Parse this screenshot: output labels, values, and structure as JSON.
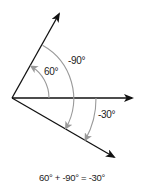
{
  "diagram": {
    "type": "angle-addition",
    "rays": [
      {
        "name": "ray-60",
        "angle_deg": 60,
        "color": "#111111"
      },
      {
        "name": "ray-0",
        "angle_deg": 0,
        "color": "#111111"
      },
      {
        "name": "ray-neg30",
        "angle_deg": -30,
        "color": "#111111"
      }
    ],
    "arcs": [
      {
        "name": "arc-60",
        "from_deg": 0,
        "to_deg": 60,
        "label": "60°",
        "color": "#999999"
      },
      {
        "name": "arc-neg90",
        "from_deg": 60,
        "to_deg": -30,
        "label": "-90°",
        "color": "#999999"
      },
      {
        "name": "arc-neg30",
        "from_deg": 0,
        "to_deg": -30,
        "label": "-30°",
        "color": "#999999"
      }
    ],
    "labels": {
      "angle_60": "60°",
      "angle_neg90": "-90°",
      "angle_neg30": "-30°"
    },
    "equation": "60° + -90° = -30°",
    "colors": {
      "ray": "#111111",
      "arc": "#999999",
      "text": "#222222"
    }
  }
}
